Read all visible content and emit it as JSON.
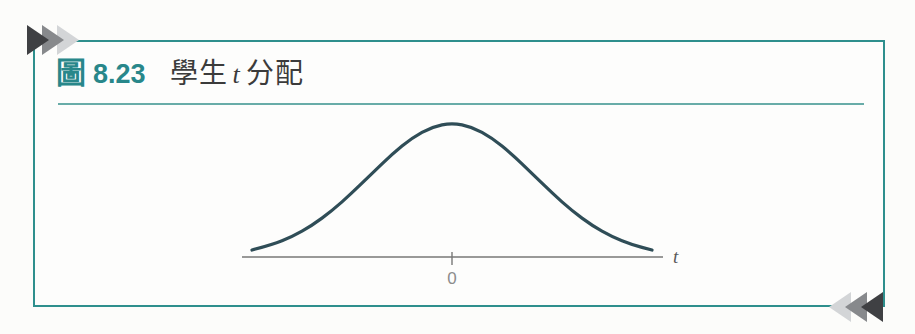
{
  "figure": {
    "label": "圖",
    "number": "8.23",
    "caption_prefix": "學生",
    "caption_italic": "t",
    "caption_suffix": "分配",
    "accent_color": "#2e8f8d"
  },
  "decorations": {
    "top_left_arrows": {
      "dark": "#3f4043",
      "mid": "#87898c",
      "light": "#d3d5d7"
    },
    "bottom_right_arrows": {
      "light": "#d3d5d7",
      "mid": "#87898c",
      "dark": "#3f4043"
    }
  },
  "chart_data": {
    "type": "line",
    "subtitle": "Student t distribution density (schematic, symmetric bell curve)",
    "xlabel": "t",
    "ylabel": "",
    "x_tick_labels": [
      "0"
    ],
    "x_tick_positions": [
      0
    ],
    "xlim": [
      -3.3,
      3.5
    ],
    "grid": false,
    "legend": false,
    "curve_color": "#2f4d57",
    "axis_color": "#777777",
    "tick_label_color": "#8c8c8c",
    "xlabel_color": "#5a5a5a",
    "series": [
      {
        "name": "student-t-density",
        "points": [
          [
            -3.0,
            0.052
          ],
          [
            -2.7,
            0.092
          ],
          [
            -2.4,
            0.151
          ],
          [
            -2.1,
            0.235
          ],
          [
            -1.8,
            0.345
          ],
          [
            -1.5,
            0.478
          ],
          [
            -1.2,
            0.624
          ],
          [
            -0.9,
            0.767
          ],
          [
            -0.6,
            0.889
          ],
          [
            -0.3,
            0.971
          ],
          [
            0.0,
            1.0
          ],
          [
            0.3,
            0.971
          ],
          [
            0.6,
            0.889
          ],
          [
            0.9,
            0.767
          ],
          [
            1.2,
            0.624
          ],
          [
            1.5,
            0.478
          ],
          [
            1.8,
            0.345
          ],
          [
            2.1,
            0.235
          ],
          [
            2.4,
            0.151
          ],
          [
            2.7,
            0.092
          ],
          [
            3.0,
            0.052
          ]
        ]
      }
    ]
  }
}
